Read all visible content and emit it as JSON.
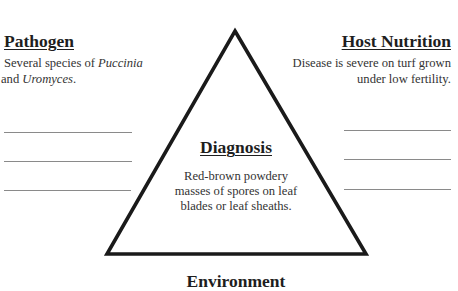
{
  "pathogen": {
    "heading": "Pathogen",
    "body_prefix": "Several species of ",
    "body_italic1": "Puccinia",
    "body_mid": " and ",
    "body_italic2": "Uromyces",
    "body_suffix": "."
  },
  "host_nutrition": {
    "heading": "Host Nutrition",
    "body_line1": "Disease is severe on turf grown",
    "body_line2": "under low fertility."
  },
  "diagnosis": {
    "heading": "Diagnosis",
    "body_line1": "Red-brown powdery",
    "body_line2": "masses of spores on leaf",
    "body_line3": "blades or leaf sheaths."
  },
  "environment": {
    "heading": "Environment"
  },
  "blank_lines": {
    "left": [
      132,
      161,
      190
    ],
    "right": [
      130,
      159,
      189
    ]
  },
  "colors": {
    "triangle_stroke": "#1a1a1a",
    "blank_line": "#8a8a8a",
    "text": "#2a2a2a"
  }
}
